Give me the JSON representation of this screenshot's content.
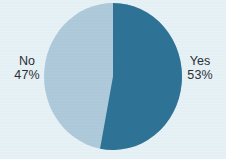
{
  "chart_data": {
    "type": "pie",
    "title": "",
    "subtitle": "",
    "xlabel": "",
    "ylabel": "",
    "legend_position": "none",
    "grid": false,
    "start_angle_deg": 0,
    "direction": "clockwise",
    "categories": [
      "Yes",
      "No"
    ],
    "values": [
      53,
      47
    ],
    "value_unit": "%",
    "slices": [
      {
        "label": "Yes",
        "value": 53,
        "value_text": "53%",
        "color": "#2e7396",
        "label_position": "right"
      },
      {
        "label": "No",
        "value": 47,
        "value_text": "47%",
        "color": "#afcadb",
        "label_position": "left"
      }
    ]
  },
  "colors": {
    "background": "#e7f2f7",
    "yes_slice": "#2e7396",
    "no_slice": "#afcadb",
    "label_text": "#2b2f33"
  },
  "labels": {
    "yes": {
      "name": "Yes",
      "value": "53%"
    },
    "no": {
      "name": "No",
      "value": "47%"
    }
  }
}
